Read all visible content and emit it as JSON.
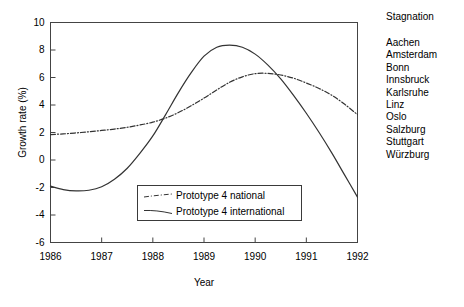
{
  "chart_data": {
    "type": "line",
    "title": "",
    "xlabel": "Year",
    "ylabel": "Growth rate (%)",
    "xlim": [
      1986,
      1992
    ],
    "ylim": [
      -6,
      10
    ],
    "xticks": [
      "1986",
      "1987",
      "1988",
      "1989",
      "1990",
      "1991",
      "1992"
    ],
    "yticks": [
      "10",
      "8",
      "6",
      "4",
      "2",
      "0",
      "-2",
      "-4",
      "-6"
    ],
    "grid": false,
    "legend_position": "lower-center-inside",
    "series": [
      {
        "name": "Prototype 4 national",
        "style": "dash-dot",
        "color": "#333333",
        "x": [
          1986,
          1986.25,
          1986.5,
          1986.75,
          1987,
          1987.25,
          1987.5,
          1987.75,
          1988,
          1988.25,
          1988.5,
          1988.75,
          1989,
          1989.25,
          1989.5,
          1989.75,
          1990,
          1990.25,
          1990.5,
          1990.75,
          1991,
          1991.25,
          1991.5,
          1991.75,
          1992
        ],
        "values": [
          1.85,
          1.9,
          1.97,
          2.05,
          2.15,
          2.25,
          2.38,
          2.55,
          2.75,
          3.05,
          3.45,
          3.95,
          4.5,
          5.1,
          5.65,
          6.05,
          6.28,
          6.3,
          6.18,
          5.95,
          5.6,
          5.2,
          4.7,
          4.05,
          3.3
        ]
      },
      {
        "name": "Prototype 4 international",
        "style": "solid",
        "color": "#333333",
        "x": [
          1986,
          1986.25,
          1986.5,
          1986.75,
          1987,
          1987.25,
          1987.5,
          1987.75,
          1988,
          1988.25,
          1988.5,
          1988.75,
          1989,
          1989.25,
          1989.5,
          1989.75,
          1990,
          1990.25,
          1990.5,
          1990.75,
          1991,
          1991.25,
          1991.5,
          1991.75,
          1992
        ],
        "values": [
          -1.9,
          -2.15,
          -2.25,
          -2.2,
          -1.95,
          -1.4,
          -0.6,
          0.5,
          1.75,
          3.3,
          4.9,
          6.35,
          7.55,
          8.2,
          8.35,
          8.2,
          7.7,
          6.9,
          5.9,
          4.7,
          3.4,
          2.0,
          0.5,
          -1.1,
          -2.7
        ]
      }
    ],
    "annotations": {
      "crossing_point": {
        "x": 1988.4,
        "y": 2.85
      }
    }
  },
  "side_caption": {
    "title": "Stagnation",
    "cities": [
      "Aachen",
      "Amsterdam",
      "Bonn",
      "Innsbruck",
      "Karlsruhe",
      "Linz",
      "Oslo",
      "Salzburg",
      "Stuttgart",
      "Würzburg"
    ]
  },
  "legend": {
    "entries": [
      {
        "label": "Prototype 4 national",
        "style": "dash-dot"
      },
      {
        "label": "Prototype 4 international",
        "style": "solid"
      }
    ]
  },
  "colors": {
    "line": "#333333",
    "axis": "#444444",
    "text": "#000000",
    "background": "#ffffff"
  }
}
